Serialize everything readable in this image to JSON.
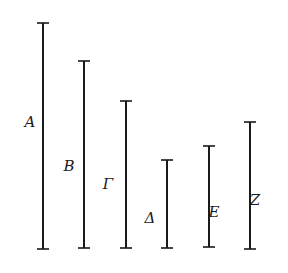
{
  "diagram": {
    "type": "line-segments",
    "segments": [
      {
        "label": "A",
        "x": 43,
        "top": 23,
        "bottom": 249,
        "label_x": 30,
        "label_y": 127,
        "label_side": "left"
      },
      {
        "label": "B",
        "x": 84,
        "top": 61,
        "bottom": 248,
        "label_x": 69,
        "label_y": 171,
        "label_side": "left"
      },
      {
        "label": "Γ",
        "x": 126,
        "top": 101,
        "bottom": 248,
        "label_x": 108,
        "label_y": 189,
        "label_side": "left"
      },
      {
        "label": "Δ",
        "x": 167,
        "top": 160,
        "bottom": 248,
        "label_x": 150,
        "label_y": 223,
        "label_side": "left"
      },
      {
        "label": "E",
        "x": 209,
        "top": 146,
        "bottom": 247,
        "label_x": 214,
        "label_y": 217,
        "label_side": "right"
      },
      {
        "label": "Z",
        "x": 250,
        "top": 122,
        "bottom": 249,
        "label_x": 255,
        "label_y": 205,
        "label_side": "right"
      }
    ]
  }
}
